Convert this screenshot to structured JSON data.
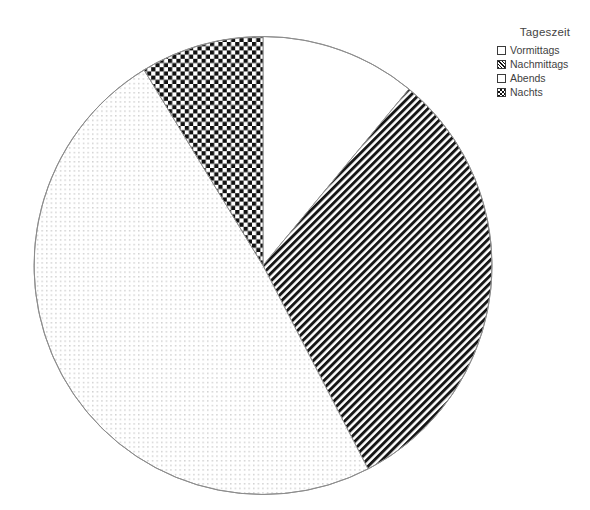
{
  "chart_data": {
    "type": "pie",
    "title": "",
    "legend_title": "Tageszeit",
    "legend_position": "right-top",
    "categories": [
      "Vormittags",
      "Nachmittags",
      "Abends",
      "Nachts"
    ],
    "values": [
      11,
      31.4,
      48.9,
      8.7
    ],
    "value_unit": "percent",
    "start_angle_deg": 0,
    "direction": "clockwise",
    "slices": [
      {
        "label": "Vormittags",
        "value": 11,
        "start_angle_deg": 0,
        "end_angle_deg": 39.6,
        "fill": "blank-white",
        "swatch": "sw-blank"
      },
      {
        "label": "Nachmittags",
        "value": 31.4,
        "start_angle_deg": 39.6,
        "end_angle_deg": 152.7,
        "fill": "diagonal-stripes",
        "swatch": "sw-diag"
      },
      {
        "label": "Abends",
        "value": 48.9,
        "start_angle_deg": 152.7,
        "end_angle_deg": 328.7,
        "fill": "fine-dots",
        "swatch": "sw-dots"
      },
      {
        "label": "Nachts",
        "value": 8.7,
        "start_angle_deg": 328.7,
        "end_angle_deg": 360,
        "fill": "checkerboard",
        "swatch": "sw-check"
      }
    ],
    "geometry": {
      "center_x": 263,
      "center_y": 265.5,
      "radius": 229
    },
    "colors": {
      "background": "#ffffff",
      "outline": "#8d8d8d",
      "pattern_dark": "#111111",
      "pattern_light": "#ffffff",
      "dot_gray": "#c9c9c9",
      "text": "#3f3f3f"
    },
    "xlabel": "",
    "ylabel": "",
    "grid": false
  },
  "legend": {
    "title": "Tageszeit",
    "items": [
      {
        "label": "Vormittags"
      },
      {
        "label": "Nachmittags"
      },
      {
        "label": "Abends"
      },
      {
        "label": "Nachts"
      }
    ]
  }
}
